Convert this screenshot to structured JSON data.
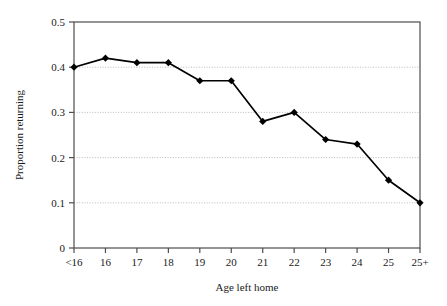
{
  "chart_data": {
    "type": "line",
    "title": "",
    "xlabel": "Age left home",
    "ylabel": "Proportion returning",
    "categories": [
      "<16",
      "16",
      "17",
      "18",
      "19",
      "20",
      "21",
      "22",
      "23",
      "24",
      "25",
      "25+"
    ],
    "values": [
      0.4,
      0.42,
      0.41,
      0.41,
      0.37,
      0.37,
      0.28,
      0.3,
      0.24,
      0.23,
      0.15,
      0.1
    ],
    "ylim": [
      0,
      0.5
    ],
    "yticks": [
      "0",
      "0.1",
      "0.2",
      "0.3",
      "0.4",
      "0.5"
    ],
    "ytick_values": [
      0,
      0.1,
      0.2,
      0.3,
      0.4,
      0.5
    ],
    "grid": "horizontal-dotted",
    "legend": "none",
    "series_color": "#000000",
    "marker": "diamond",
    "plot_border_color": "#4d4d4d",
    "gridline_color": "#b3b3b3",
    "background_color": "#ffffff"
  }
}
